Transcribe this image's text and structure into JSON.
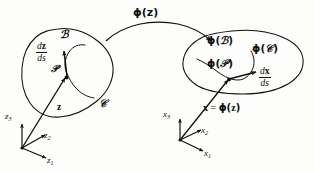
{
  "figure": {
    "background_color": "#fdfdfb",
    "ink_color": "#12110f"
  },
  "map_arrow": {
    "label_phi": "ϕ",
    "label_open": "(",
    "label_arg": "z",
    "label_close": ")",
    "label_full": "ϕ(z)"
  },
  "reference_config": {
    "body_label": "ℬ",
    "point_label": "𝒫",
    "curve_label": "𝒞",
    "position_vector": "z",
    "tangent": {
      "numerator_d": "d",
      "numerator_var": "z",
      "denominator": "ds",
      "full": "dz/ds"
    },
    "axes": [
      {
        "name": "z1",
        "base": "z",
        "subscript": "1"
      },
      {
        "name": "z2",
        "base": "z",
        "subscript": "2"
      },
      {
        "name": "z3",
        "base": "z",
        "subscript": "3"
      }
    ]
  },
  "deformed_config": {
    "body_label_phi": "ϕ",
    "body_label_arg": "ℬ",
    "body_label_full": "ϕ(ℬ)",
    "curve_label_phi": "ϕ",
    "curve_label_arg": "𝒞",
    "curve_label_full": "ϕ(𝒞)",
    "point_label_phi": "ϕ",
    "point_label_arg": "𝒫",
    "point_label_full": "ϕ(𝒫)",
    "position_relation": {
      "lhs": "x",
      "equals": "=",
      "rhs_phi": "ϕ",
      "rhs_arg": "z",
      "full": "x = ϕ(z)"
    },
    "tangent": {
      "numerator_d": "d",
      "numerator_var": "x",
      "denominator": "ds",
      "full": "dx/ds"
    },
    "axes": [
      {
        "name": "x1",
        "base": "x",
        "subscript": "1"
      },
      {
        "name": "x2",
        "base": "x",
        "subscript": "2"
      },
      {
        "name": "x3",
        "base": "x",
        "subscript": "3"
      }
    ]
  }
}
